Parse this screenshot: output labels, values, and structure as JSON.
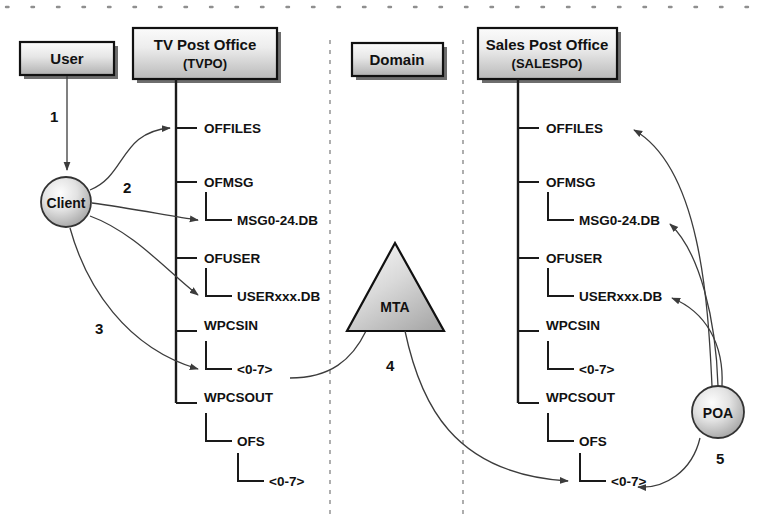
{
  "diagram": {
    "colors": {
      "ink": "#111111",
      "line": "#3c3c3c",
      "divider": "#9a9a9a",
      "box_fill_light": "#f2f2f2",
      "box_fill_dark": "#b4b4b4",
      "shadow": "#555555"
    },
    "nodes": {
      "user": {
        "label": "User"
      },
      "tvpo": {
        "label": "TV Post Office",
        "sublabel": "(TVPO)"
      },
      "domain": {
        "label": "Domain"
      },
      "salespo": {
        "label": "Sales Post Office",
        "sublabel": "(SALESPO)"
      },
      "client": {
        "label": "Client"
      },
      "mta": {
        "label": "MTA"
      },
      "poa": {
        "label": "POA"
      }
    },
    "steps": [
      {
        "id": "step-1",
        "label": "1"
      },
      {
        "id": "step-2",
        "label": "2"
      },
      {
        "id": "step-3",
        "label": "3"
      },
      {
        "id": "step-4",
        "label": "4"
      },
      {
        "id": "step-5",
        "label": "5"
      }
    ],
    "tvpo_tree": [
      {
        "name": "OFFILES",
        "depth": 0
      },
      {
        "name": "OFMSG",
        "depth": 0
      },
      {
        "name": "MSG0-24.DB",
        "depth": 1
      },
      {
        "name": "OFUSER",
        "depth": 0
      },
      {
        "name": "USERxxx.DB",
        "depth": 1
      },
      {
        "name": "WPCSIN",
        "depth": 0
      },
      {
        "name": "<0-7>",
        "depth": 1
      },
      {
        "name": "WPCSOUT",
        "depth": 0
      },
      {
        "name": "OFS",
        "depth": 1
      },
      {
        "name": "<0-7>",
        "depth": 2
      }
    ],
    "salespo_tree": [
      {
        "name": "OFFILES",
        "depth": 0
      },
      {
        "name": "OFMSG",
        "depth": 0
      },
      {
        "name": "MSG0-24.DB",
        "depth": 1
      },
      {
        "name": "OFUSER",
        "depth": 0
      },
      {
        "name": "USERxxx.DB",
        "depth": 1
      },
      {
        "name": "WPCSIN",
        "depth": 0
      },
      {
        "name": "<0-7>",
        "depth": 1
      },
      {
        "name": "WPCSOUT",
        "depth": 0
      },
      {
        "name": "OFS",
        "depth": 1
      },
      {
        "name": "<0-7>",
        "depth": 2
      }
    ]
  }
}
